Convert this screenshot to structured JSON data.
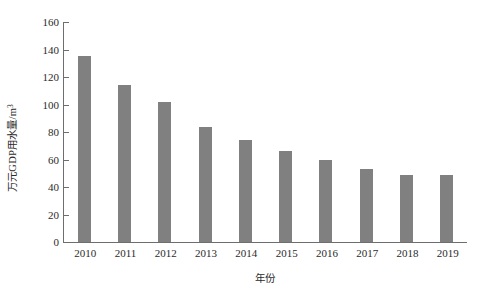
{
  "chart_data": {
    "type": "bar",
    "title": "",
    "subtitle": "",
    "xlabel": "年份",
    "ylabel": "万元GDP用水量/m",
    "ylabel_superscript": "3",
    "categories": [
      "2010",
      "2011",
      "2012",
      "2013",
      "2014",
      "2015",
      "2016",
      "2017",
      "2018",
      "2019"
    ],
    "values": [
      135,
      114,
      102,
      84,
      74,
      66,
      60,
      53,
      49,
      49
    ],
    "series": [
      {
        "name": "万元GDP用水量",
        "values": [
          135,
          114,
          102,
          84,
          74,
          66,
          60,
          53,
          49,
          49
        ]
      }
    ],
    "ylim": [
      0,
      160
    ],
    "yticks": [
      0,
      20,
      40,
      60,
      80,
      100,
      120,
      140,
      160
    ],
    "ytick_labels": [
      "0",
      "20",
      "40",
      "60",
      "80",
      "100",
      "120",
      "140",
      "160"
    ],
    "xtick_labels": [
      "2010",
      "2011",
      "2012",
      "2013",
      "2014",
      "2015",
      "2016",
      "2017",
      "2018",
      "2019"
    ],
    "grid": false,
    "legend": false,
    "legend_position": "none",
    "bar_color": "#808080",
    "axis_color": "#6e6e6e",
    "background_color": "#ffffff",
    "annotations": []
  }
}
